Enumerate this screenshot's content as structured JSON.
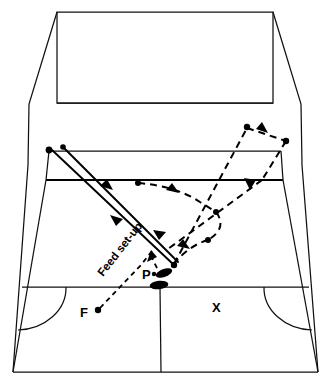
{
  "diagram": {
    "type": "sports-court-perspective",
    "labels": [
      {
        "id": "feed-setup",
        "text": "Feed set-up",
        "x": 118,
        "y": 268,
        "rotation": -52
      },
      {
        "id": "player-p",
        "text": "P",
        "x": 147,
        "y": 277
      },
      {
        "id": "feeder-f",
        "text": "F",
        "x": 86,
        "y": 316
      },
      {
        "id": "partner-x",
        "text": "X",
        "x": 215,
        "y": 308
      }
    ],
    "colors": {
      "background": "#ffffff",
      "line": "#111111",
      "ink": "#000000"
    },
    "court": {
      "outer_boundary": "M 57,12 L 273,12 L 300,160 L 318,372 L 13,372 L 30,160 Z",
      "near_baseline_y": 372,
      "far_baseline_y": 12,
      "center_service_line_x": 159,
      "short_service_line_y": 286,
      "net_top_y": 151,
      "net_bottom_y": 180,
      "far_service_line_y": 103
    },
    "markers": {
      "footprints": [
        {
          "cx": 163,
          "cy": 274,
          "rx": 8.5,
          "ry": 4.2,
          "rotation": -22
        },
        {
          "cx": 159,
          "cy": 285,
          "rx": 9.5,
          "ry": 4.4,
          "rotation": -6
        }
      ],
      "dots": [
        {
          "id": "net-dot-left",
          "cx": 49,
          "cy": 150
        },
        {
          "id": "net-dot-left2",
          "cx": 62,
          "cy": 148
        },
        {
          "id": "dot-midcourt-left",
          "cx": 138,
          "cy": 183
        },
        {
          "id": "dot-center",
          "cx": 215,
          "cy": 212
        },
        {
          "id": "dot-rear-right",
          "cx": 207,
          "cy": 240
        },
        {
          "id": "dot-far-right-top",
          "cx": 247,
          "cy": 127
        },
        {
          "id": "dot-far-right-side",
          "cx": 286,
          "cy": 141
        },
        {
          "id": "dot-rally-end",
          "cx": 172,
          "cy": 265
        },
        {
          "id": "dot-feed-f",
          "cx": 97,
          "cy": 311
        }
      ]
    },
    "paths": {
      "solid_shots": [
        {
          "id": "shot-out-to-rear",
          "from": [
            52,
            150
          ],
          "to": [
            172,
            265
          ]
        },
        {
          "id": "shot-net-drop",
          "from": [
            62,
            148
          ],
          "to": [
            175,
            264
          ]
        }
      ],
      "dashed_movement": [
        {
          "id": "move-net-to-mid",
          "points": "138,183 175,191 215,212"
        },
        {
          "id": "move-mid-to-rear",
          "points": "215,212 226,229 207,240"
        },
        {
          "id": "move-rear-to-end",
          "points": "207,240 186,250 172,265"
        },
        {
          "id": "move-end-to-far-right",
          "points": "172,265 215,212 247,127"
        },
        {
          "id": "move-far-right-across",
          "points": "247,127 267,133 286,141"
        },
        {
          "id": "move-far-right-down",
          "points": "286,141 268,165 245,185"
        },
        {
          "id": "move-diagonal-down",
          "points": "245,185 210,225 168,248"
        },
        {
          "id": "move-feed-to-p",
          "points": "97,311 140,268 158,252"
        },
        {
          "id": "move-p-short",
          "points": "156,268 148,254"
        }
      ]
    }
  }
}
